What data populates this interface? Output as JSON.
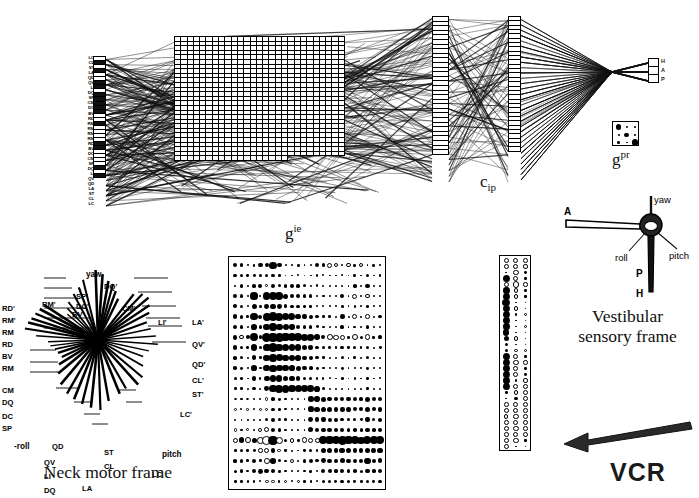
{
  "figure": {
    "annotation_vcr": "VCR"
  },
  "network": {
    "layer_labels": {
      "gie": "g",
      "gie_sup": "ie",
      "cip": "c",
      "cip_sub": "ip",
      "gpr": "g",
      "gpr_sup": "pr"
    },
    "input_unit_labels": [
      "LC",
      "CL",
      "ST",
      "LA",
      "QD",
      "QV",
      "LI",
      "DQ",
      "SP",
      "CM",
      "DC",
      "BV",
      "RD",
      "RM",
      "RM",
      "RM",
      "RM",
      "RD",
      "BV",
      "DC",
      "CM",
      "SP",
      "DQ",
      "LI",
      "QV",
      "QD",
      "LA",
      "ST",
      "CL",
      "LC"
    ],
    "output_unit_labels": [
      "H",
      "A",
      "P"
    ]
  },
  "hinton_main": {
    "name": "main-weight-matrix",
    "rows": 22,
    "cols": 24,
    "values": [
      [
        0.45,
        0.42,
        0.18,
        0.3,
        0.48,
        0.45,
        0.78,
        0.5,
        0.22,
        0.2,
        0.3,
        0.18,
        0.25,
        0.42,
        0.4,
        -0.52,
        -0.46,
        0.25,
        -0.48,
        0.3,
        -0.5,
        0.2,
        0.3,
        0.18
      ],
      [
        0.42,
        0.4,
        0.3,
        0.32,
        0.4,
        0.38,
        0.42,
        0.3,
        0.2,
        0.18,
        0.22,
        0.16,
        0.2,
        0.26,
        0.22,
        0.2,
        0.18,
        0.22,
        0.18,
        0.3,
        0.2,
        0.42,
        0.2,
        0.25
      ],
      [
        0.2,
        0.42,
        0.22,
        0.4,
        0.45,
        -0.3,
        0.42,
        0.38,
        0.4,
        0.42,
        0.4,
        0.38,
        0.25,
        0.3,
        0.25,
        0.22,
        0.18,
        0.25,
        0.2,
        0.4,
        0.22,
        0.45,
        0.18,
        0.2
      ],
      [
        0.45,
        0.4,
        0.25,
        0.78,
        0.22,
        0.8,
        0.95,
        0.82,
        0.55,
        0.48,
        0.45,
        0.42,
        0.38,
        0.3,
        0.28,
        0.25,
        0.22,
        0.45,
        0.2,
        -0.55,
        0.25,
        -0.48,
        0.22,
        0.3
      ],
      [
        0.42,
        0.38,
        0.22,
        0.55,
        0.3,
        0.52,
        0.6,
        0.52,
        0.42,
        0.4,
        0.38,
        0.3,
        0.28,
        0.25,
        0.22,
        0.2,
        0.18,
        0.3,
        0.18,
        0.28,
        0.2,
        0.3,
        0.18,
        0.25
      ],
      [
        0.48,
        0.42,
        0.3,
        0.8,
        0.45,
        0.85,
        0.92,
        0.88,
        0.82,
        0.78,
        0.6,
        0.48,
        0.42,
        0.38,
        0.3,
        0.28,
        0.25,
        0.5,
        0.22,
        -0.52,
        0.25,
        -0.5,
        0.25,
        0.35
      ],
      [
        0.45,
        0.4,
        0.25,
        0.62,
        0.35,
        0.7,
        0.8,
        0.72,
        0.65,
        0.6,
        0.5,
        0.42,
        0.38,
        0.32,
        0.28,
        0.25,
        0.22,
        0.4,
        0.2,
        0.3,
        0.22,
        0.38,
        0.2,
        0.3
      ],
      [
        0.5,
        -0.45,
        0.42,
        0.88,
        0.4,
        1.0,
        1.0,
        0.95,
        0.9,
        0.88,
        0.85,
        0.8,
        0.72,
        0.6,
        0.45,
        -0.62,
        -0.58,
        -0.55,
        0.3,
        -0.68,
        0.35,
        -0.6,
        0.28,
        0.4
      ],
      [
        0.45,
        0.38,
        0.3,
        0.7,
        0.35,
        0.85,
        0.92,
        0.85,
        0.78,
        0.72,
        0.68,
        0.6,
        0.5,
        0.42,
        0.35,
        0.3,
        0.28,
        0.42,
        0.25,
        0.35,
        0.25,
        0.42,
        0.22,
        0.32
      ],
      [
        0.4,
        0.35,
        0.25,
        0.52,
        0.3,
        0.72,
        0.8,
        0.75,
        0.7,
        0.65,
        0.58,
        0.5,
        0.42,
        0.35,
        0.3,
        0.25,
        0.22,
        0.35,
        0.2,
        0.3,
        0.22,
        0.35,
        0.2,
        0.28
      ],
      [
        0.38,
        0.32,
        0.22,
        0.62,
        0.28,
        0.7,
        0.78,
        0.72,
        0.68,
        0.62,
        0.55,
        0.48,
        0.4,
        0.32,
        0.28,
        0.25,
        0.2,
        0.32,
        0.18,
        0.28,
        0.2,
        0.32,
        0.18,
        0.25
      ],
      [
        0.35,
        0.3,
        0.2,
        0.48,
        0.25,
        0.62,
        0.72,
        0.68,
        0.62,
        0.58,
        0.5,
        0.42,
        0.35,
        0.3,
        0.25,
        0.22,
        0.18,
        0.28,
        0.18,
        0.25,
        0.18,
        0.3,
        0.18,
        0.22
      ],
      [
        0.3,
        0.28,
        0.2,
        0.35,
        0.25,
        0.52,
        0.78,
        0.85,
        0.82,
        0.8,
        0.78,
        0.75,
        0.72,
        0.62,
        0.35,
        0.25,
        0.2,
        0.25,
        0.18,
        0.22,
        0.18,
        0.28,
        0.18,
        0.22
      ],
      [
        -0.3,
        0.25,
        -0.28,
        0.3,
        0.22,
        -0.38,
        0.4,
        0.32,
        0.28,
        0.25,
        0.22,
        0.2,
        0.6,
        0.58,
        0.55,
        0.52,
        0.5,
        0.48,
        0.45,
        0.42,
        0.4,
        0.55,
        0.42,
        0.48
      ],
      [
        -0.32,
        0.22,
        -0.3,
        0.25,
        -0.35,
        -0.4,
        0.38,
        0.3,
        0.25,
        0.22,
        0.2,
        0.18,
        0.62,
        0.6,
        0.58,
        0.55,
        0.52,
        0.5,
        0.48,
        0.45,
        0.42,
        0.58,
        0.45,
        0.5
      ],
      [
        0.22,
        0.2,
        0.18,
        0.22,
        0.2,
        0.38,
        0.42,
        0.38,
        0.3,
        0.25,
        0.22,
        0.2,
        0.52,
        0.5,
        0.48,
        0.45,
        0.42,
        0.4,
        0.38,
        0.35,
        0.32,
        0.48,
        0.38,
        0.42
      ],
      [
        -0.35,
        0.25,
        -0.32,
        0.28,
        -0.42,
        -0.55,
        0.48,
        0.35,
        0.28,
        0.25,
        0.2,
        0.18,
        0.55,
        0.52,
        0.5,
        0.48,
        0.45,
        0.42,
        0.4,
        0.38,
        0.35,
        0.5,
        0.4,
        0.45
      ],
      [
        -0.55,
        0.6,
        -0.7,
        0.55,
        -0.72,
        -0.95,
        1.0,
        -0.75,
        0.35,
        -0.5,
        0.3,
        -0.62,
        -0.58,
        -0.55,
        0.85,
        0.92,
        0.88,
        0.95,
        0.9,
        0.85,
        0.8,
        0.88,
        0.82,
        0.9
      ],
      [
        0.3,
        0.35,
        0.28,
        0.32,
        -0.48,
        -0.58,
        0.45,
        -0.4,
        0.25,
        0.22,
        0.2,
        0.25,
        0.35,
        0.3,
        0.58,
        0.55,
        0.52,
        0.6,
        0.55,
        0.5,
        0.48,
        0.55,
        0.5,
        0.58
      ],
      [
        0.4,
        0.38,
        0.3,
        0.48,
        0.3,
        -0.62,
        0.6,
        0.35,
        0.28,
        -0.42,
        0.25,
        0.38,
        0.42,
        0.35,
        0.52,
        0.5,
        0.48,
        0.55,
        0.5,
        0.45,
        0.42,
        0.72,
        0.48,
        0.52
      ],
      [
        0.35,
        0.42,
        0.28,
        0.45,
        0.52,
        0.5,
        0.48,
        0.3,
        0.25,
        0.22,
        0.2,
        0.25,
        0.3,
        0.28,
        0.45,
        0.42,
        0.4,
        0.48,
        0.42,
        0.38,
        0.35,
        0.45,
        0.4,
        0.45
      ],
      [
        0.3,
        0.28,
        0.25,
        0.3,
        0.22,
        -0.42,
        -0.4,
        0.25,
        -0.38,
        0.22,
        -0.35,
        0.28,
        0.25,
        0.22,
        0.38,
        0.35,
        0.32,
        0.4,
        0.35,
        0.32,
        0.3,
        0.38,
        0.32,
        0.35
      ]
    ]
  },
  "hinton_strip": {
    "name": "cip-weight-strip",
    "rows": 32,
    "cols": 3,
    "values": [
      [
        -0.62,
        -0.6,
        -0.55
      ],
      [
        -0.58,
        -0.62,
        -0.5
      ],
      [
        0.2,
        -0.7,
        0.35
      ],
      [
        0.85,
        -0.6,
        0.3
      ],
      [
        -0.55,
        -0.72,
        -0.52
      ],
      [
        0.78,
        -0.55,
        0.28
      ],
      [
        0.9,
        -0.48,
        0.25
      ],
      [
        0.92,
        0.22,
        0.2
      ],
      [
        0.88,
        -0.5,
        0.22
      ],
      [
        0.85,
        0.25,
        -0.45
      ],
      [
        0.82,
        0.2,
        0.18
      ],
      [
        0.8,
        0.22,
        -0.42
      ],
      [
        0.75,
        0.18,
        0.2
      ],
      [
        0.6,
        -0.48,
        0.22
      ],
      [
        0.42,
        0.2,
        0.18
      ],
      [
        0.38,
        -0.45,
        -0.4
      ],
      [
        0.85,
        -0.62,
        0.3
      ],
      [
        0.88,
        -0.65,
        -0.55
      ],
      [
        0.82,
        -0.58,
        0.32
      ],
      [
        0.9,
        -0.6,
        0.35
      ],
      [
        0.8,
        0.25,
        -0.5
      ],
      [
        0.85,
        -0.62,
        -0.58
      ],
      [
        0.3,
        -0.55,
        -0.62
      ],
      [
        0.22,
        0.4,
        -0.7
      ],
      [
        -0.55,
        -0.58,
        -0.6
      ],
      [
        -0.6,
        -0.62,
        -0.55
      ],
      [
        -0.52,
        -0.65,
        -0.58
      ],
      [
        -0.58,
        -0.6,
        -0.62
      ],
      [
        -0.62,
        -0.68,
        -0.55
      ],
      [
        -0.55,
        -0.62,
        -0.6
      ],
      [
        -0.6,
        -0.7,
        0.25
      ],
      [
        -0.65,
        0.2,
        0.18
      ]
    ]
  },
  "hinton_gpr": {
    "name": "gpr-weight-box",
    "rows": 3,
    "cols": 3,
    "values": [
      [
        0.85,
        0.3,
        0.22
      ],
      [
        0.28,
        0.7,
        0.25
      ],
      [
        0.35,
        0.2,
        0.95
      ]
    ]
  },
  "neck_motor_frame": {
    "title": "Neck motor frame",
    "axis_labels": [
      "yaw",
      "pitch",
      "-roll"
    ],
    "muscle_labels_upper_left": [
      "RD'",
      "RM'",
      "RM",
      "RD",
      "BV",
      "RM"
    ],
    "muscle_labels_upper_mid": [
      "RM'",
      "BV'",
      "SP'",
      "DC'",
      "DQ'",
      "CM'"
    ],
    "muscle_labels_right": [
      "LI'",
      "LA'",
      "QV'",
      "QD'",
      "CL'",
      "ST'",
      "LC'"
    ],
    "muscle_labels_lower_left": [
      "CM",
      "DQ",
      "DC",
      "SP"
    ],
    "muscle_labels_lower_mid": [
      "QD",
      "QV",
      "LI",
      "DQ",
      "LA",
      "ST",
      "CL"
    ],
    "muscle_labels_lower_right": [
      "LC"
    ]
  },
  "vestibular_frame": {
    "title_line1": "Vestibular",
    "title_line2": "sensory frame",
    "axis_labels": [
      "yaw",
      "roll",
      "pitch"
    ],
    "canal_labels": [
      "A",
      "P",
      "H"
    ]
  }
}
